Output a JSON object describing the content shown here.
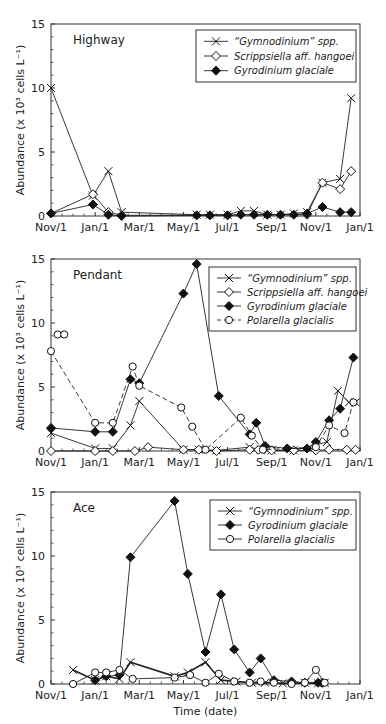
{
  "chart_data": [
    {
      "type": "line",
      "panel_label": "Highway",
      "ylabel": "Abundance (x 10³ cells L⁻¹)",
      "xlabel": "",
      "x_unit": "months since Nov/1",
      "xlim": [
        0,
        14
      ],
      "ylim": [
        0,
        15
      ],
      "xticks": [
        0,
        2,
        4,
        6,
        8,
        10,
        12,
        14
      ],
      "xtick_labels": [
        "Nov/1",
        "Jan/1",
        "Mar/1",
        "May/1",
        "Jul/1",
        "Sep/1",
        "Nov/1",
        "Jan/1"
      ],
      "yticks": [
        0,
        5,
        10,
        15
      ],
      "ytick_labels": [
        "0",
        "5",
        "10",
        "15"
      ],
      "legend_position": "top-right",
      "series": [
        {
          "name": "“Gymnodinium” spp.",
          "marker": "x",
          "dash": "solid",
          "x": [
            0,
            1.9,
            2.6,
            3.2,
            6.6,
            7.2,
            8.0,
            8.6,
            9.2,
            9.8,
            10.4,
            11.0,
            11.6,
            12.3,
            13.1,
            13.6
          ],
          "y": [
            10.0,
            1.6,
            3.5,
            0.3,
            0.1,
            0.1,
            0.1,
            0.4,
            0.4,
            0.1,
            0.1,
            0.2,
            0.3,
            2.6,
            2.9,
            9.2
          ]
        },
        {
          "name": "Scrippsiella aff. hangoei",
          "marker": "diamond-open",
          "dash": "solid",
          "x": [
            0,
            1.9,
            2.6,
            3.2,
            11.6,
            12.3,
            13.1,
            13.6
          ],
          "y": [
            0.2,
            1.7,
            0.3,
            0.05,
            0.1,
            2.6,
            2.1,
            3.5
          ]
        },
        {
          "name": "Gyrodinium glaciale",
          "marker": "diamond-filled",
          "dash": "solid",
          "x": [
            0,
            1.9,
            2.6,
            3.2,
            6.6,
            7.2,
            8.0,
            8.6,
            9.2,
            9.8,
            10.4,
            11.0,
            11.6,
            12.3,
            13.1,
            13.6
          ],
          "y": [
            0.2,
            0.9,
            0.1,
            0.0,
            0.05,
            0.05,
            0.05,
            0.1,
            0.1,
            0.1,
            0.1,
            0.1,
            0.2,
            0.7,
            0.3,
            0.3
          ]
        }
      ]
    },
    {
      "type": "line",
      "panel_label": "Pendant",
      "ylabel": "Abundance (x 10³ cells L⁻¹)",
      "xlabel": "",
      "x_unit": "months since Nov/1",
      "xlim": [
        0,
        14
      ],
      "ylim": [
        0,
        15
      ],
      "xticks": [
        0,
        2,
        4,
        6,
        8,
        10,
        12,
        14
      ],
      "xtick_labels": [
        "Nov/1",
        "Jan/1",
        "Mar/1",
        "May/1",
        "Jul/1",
        "Sep/1",
        "Nov/1",
        "Jan/1"
      ],
      "yticks": [
        0,
        5,
        10,
        15
      ],
      "ytick_labels": [
        "0",
        "5",
        "10",
        "15"
      ],
      "legend_position": "top-right",
      "series": [
        {
          "name": "“Gymnodinium” spp.",
          "marker": "x",
          "dash": "solid",
          "x": [
            0,
            2.0,
            2.8,
            3.6,
            4.0,
            6.0,
            6.7,
            7.5,
            9.0,
            9.5,
            10.0,
            11.0,
            12.5,
            13.0,
            13.5,
            13.8
          ],
          "y": [
            1.4,
            0.2,
            0.2,
            2.0,
            3.9,
            0.1,
            0.1,
            0.05,
            0.3,
            0.1,
            0.05,
            0.05,
            0.7,
            4.7,
            3.8,
            3.8
          ]
        },
        {
          "name": "Scrippsiella aff. hangoei",
          "marker": "diamond-open",
          "dash": "solid",
          "x": [
            0,
            2.0,
            2.8,
            3.8,
            4.4,
            6.0,
            6.7,
            7.5,
            9.0,
            9.4,
            10.0,
            11.0,
            12.0,
            12.6,
            13.4,
            13.8
          ],
          "y": [
            0.0,
            0.0,
            0.0,
            0.0,
            0.3,
            0.1,
            0.1,
            0.0,
            0.1,
            0.1,
            0.05,
            0.05,
            0.05,
            0.1,
            0.1,
            0.1
          ]
        },
        {
          "name": "Gyrodinium glaciale",
          "marker": "diamond-filled",
          "dash": "solid",
          "x": [
            0,
            2.0,
            2.8,
            3.6,
            4.0,
            6.0,
            6.6,
            7.6,
            9.0,
            9.3,
            9.7,
            10.7,
            11.6,
            12.0,
            12.6,
            13.1,
            13.7
          ],
          "y": [
            1.8,
            1.5,
            1.5,
            5.6,
            5.3,
            12.3,
            14.6,
            4.3,
            1.3,
            2.2,
            0.4,
            0.2,
            0.2,
            0.7,
            2.4,
            3.3,
            7.3
          ]
        },
        {
          "name": "Polarella glacialis",
          "marker": "circle-open",
          "dash": "dashed",
          "x": [
            0,
            2.0,
            2.8,
            3.7,
            4.0,
            5.9,
            6.4,
            7.0,
            8.6,
            9.1,
            9.6,
            12.0,
            12.6,
            13.3,
            13.7
          ],
          "y": [
            7.8,
            2.2,
            2.2,
            6.6,
            5.1,
            3.4,
            1.9,
            0.1,
            2.6,
            1.2,
            0.1,
            0.3,
            2.0,
            1.4,
            3.8
          ]
        },
        {
          "name": "Polarella glacialis (unconnected)",
          "marker": "circle-open",
          "dash": "none",
          "x": [
            0.3,
            0.6
          ],
          "y": [
            9.1,
            9.1
          ]
        }
      ]
    },
    {
      "type": "line",
      "panel_label": "Ace",
      "ylabel": "Abundance (x 10³ cells L⁻¹)",
      "xlabel": "Time (date)",
      "x_unit": "months since Nov/1",
      "xlim": [
        0,
        14
      ],
      "ylim": [
        0,
        15
      ],
      "xticks": [
        0,
        2,
        4,
        6,
        8,
        10,
        12,
        14
      ],
      "xtick_labels": [
        "Nov/1",
        "Jan/1",
        "Mar/1",
        "May/1",
        "Jul/1",
        "Sep/1",
        "Nov/1",
        "Jan/1"
      ],
      "yticks": [
        0,
        5,
        10,
        15
      ],
      "ytick_labels": [
        "0",
        "5",
        "10",
        "15"
      ],
      "legend_position": "top-right",
      "series": [
        {
          "name": "“Gymnodinium” spp.",
          "marker": "x",
          "dash": "solid",
          "bold": true,
          "x": [
            1.0,
            2.0,
            2.5,
            3.1,
            3.6,
            5.6,
            6.2,
            7.0,
            7.7,
            8.4,
            9.1,
            9.7,
            10.5,
            11.5,
            12.1,
            12.4
          ],
          "y": [
            1.1,
            0.3,
            0.6,
            0.4,
            1.7,
            0.6,
            0.9,
            1.7,
            0.3,
            0.2,
            0.1,
            0.1,
            0.05,
            0.1,
            0.05,
            0.1
          ]
        },
        {
          "name": "Gyrodinium glaciale",
          "marker": "diamond-filled",
          "dash": "solid",
          "x": [
            2.0,
            2.5,
            3.1,
            3.6,
            5.6,
            6.2,
            7.0,
            7.7,
            8.3,
            9.0,
            9.5,
            10.1,
            10.9,
            11.5,
            12.1,
            12.3
          ],
          "y": [
            0.3,
            0.6,
            0.7,
            9.9,
            14.3,
            8.6,
            2.5,
            7.0,
            2.7,
            0.9,
            2.0,
            0.3,
            0.2,
            0.1,
            0.1,
            0.1
          ]
        },
        {
          "name": "Polarella glacialis",
          "marker": "circle-open",
          "dash": "solid",
          "x": [
            1.0,
            2.0,
            2.5,
            3.1,
            3.7,
            5.6,
            6.3,
            7.0,
            7.6,
            8.3,
            9.0,
            9.5,
            10.1,
            10.9,
            11.5,
            12.0,
            12.4
          ],
          "y": [
            0.0,
            0.9,
            0.9,
            1.1,
            0.4,
            0.5,
            0.7,
            0.1,
            0.8,
            0.2,
            0.1,
            0.2,
            0.1,
            0.0,
            0.1,
            1.1,
            0.1
          ]
        }
      ]
    }
  ]
}
